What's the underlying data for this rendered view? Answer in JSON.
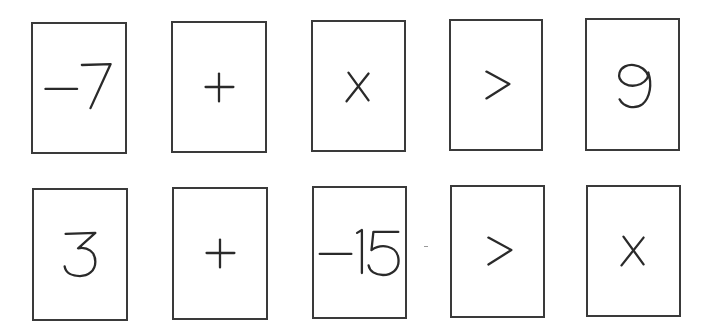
{
  "rows": [
    {
      "name": "row-1",
      "cards": [
        {
          "value": "−7",
          "glyph": "neg7",
          "box": [
            31,
            22,
            96,
            132
          ]
        },
        {
          "value": "+",
          "glyph": "plus",
          "box": [
            171,
            21,
            96,
            132
          ]
        },
        {
          "value": "x",
          "glyph": "x",
          "box": [
            311,
            20,
            95,
            132
          ]
        },
        {
          "value": ">",
          "glyph": "gt",
          "box": [
            449,
            19,
            94,
            132
          ]
        },
        {
          "value": "9",
          "glyph": "nine",
          "box": [
            585,
            18,
            95,
            133
          ]
        }
      ]
    },
    {
      "name": "row-2",
      "cards": [
        {
          "value": "3",
          "glyph": "three",
          "box": [
            32,
            188,
            96,
            133
          ]
        },
        {
          "value": "+",
          "glyph": "plus",
          "box": [
            172,
            187,
            96,
            133
          ]
        },
        {
          "value": "−15",
          "glyph": "neg15",
          "box": [
            312,
            186,
            95,
            133
          ]
        },
        {
          "value": ">",
          "glyph": "gt",
          "box": [
            450,
            185,
            95,
            133
          ]
        },
        {
          "value": "x",
          "glyph": "x",
          "box": [
            586,
            185,
            95,
            132
          ]
        }
      ]
    }
  ],
  "colors": {
    "border": "#3a3a3a",
    "ink": "#2a2a2a",
    "background": "#ffffff"
  }
}
